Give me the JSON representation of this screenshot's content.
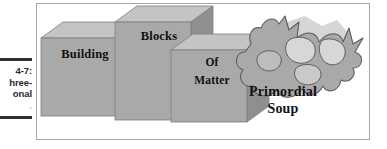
{
  "caption": {
    "lines": [
      "4-7:",
      "hree-",
      "onal"
    ],
    "faint_line": "."
  },
  "figure": {
    "blocks": [
      {
        "label": "Building"
      },
      {
        "label": "Blocks"
      },
      {
        "label_line1": "Of",
        "label_line2": "Matter"
      }
    ],
    "blob": {
      "label_line1": "Primordial",
      "label_line2": "Soup"
    }
  },
  "colors": {
    "block_front": "#a9a9a9",
    "block_top": "#c4c4c4",
    "block_side": "#8f8f8f",
    "blob_fill": "#a9a9a9",
    "blob_light": "#d5d5d5",
    "blob_shadow": "#c9c9c9",
    "frame_border": "#a9a9a9",
    "caption_rule": "#2f2f2f",
    "text": "#111111",
    "background": "#ffffff"
  }
}
